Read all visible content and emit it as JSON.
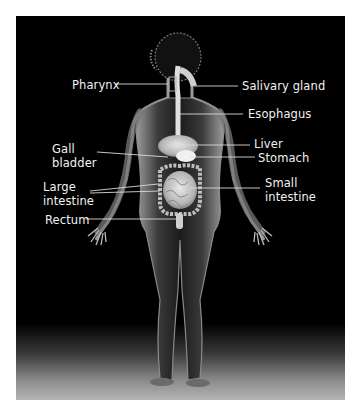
{
  "diagram": {
    "background_color": "#000000",
    "label_color": "#f2f2f2",
    "leader_line_color": "#d9d9d9"
  },
  "labels": {
    "pharynx": "Pharynx",
    "salivary_gland": "Salivary gland",
    "esophagus": "Esophagus",
    "liver": "Liver",
    "stomach": "Stomach",
    "gall_bladder_line1": "Gall",
    "gall_bladder_line2": "bladder",
    "large_intestine_line1": "Large",
    "large_intestine_line2": "intestine",
    "small_intestine_line1": "Small",
    "small_intestine_line2": "intestine",
    "rectum": "Rectum"
  }
}
